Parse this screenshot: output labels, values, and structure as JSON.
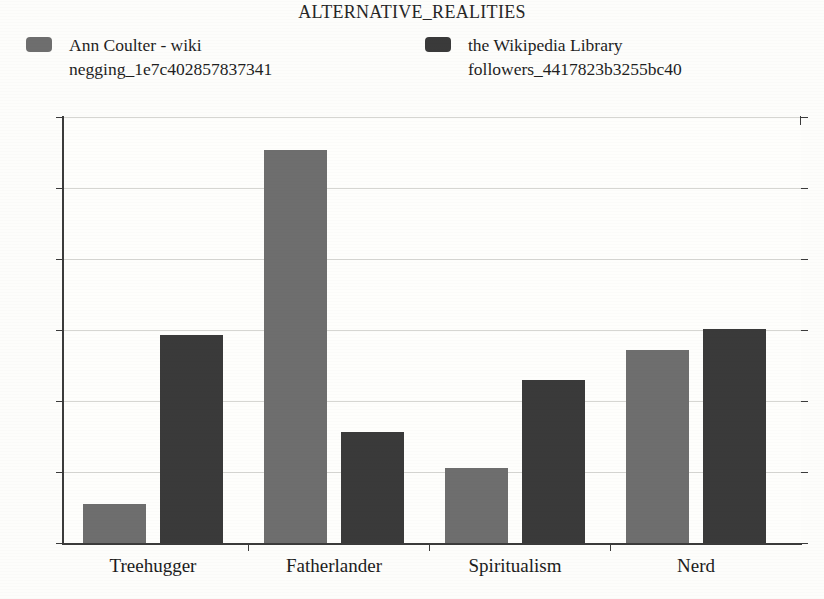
{
  "chart_data": {
    "type": "bar",
    "title": "ALTERNATIVE_REALITIES",
    "xlabel": "",
    "ylabel": "",
    "categories": [
      "Treehugger",
      "Fatherlander",
      "Spiritualism",
      "Nerd"
    ],
    "series": [
      {
        "name": "Ann Coulter - wiki negging_1e7c402857837341",
        "color": "#6e6e6e",
        "values": [
          0.055,
          0.553,
          0.105,
          0.272
        ]
      },
      {
        "name": "the Wikipedia Library followers_4417823b3255bc40",
        "color": "#3a3a3a",
        "values": [
          0.293,
          0.157,
          0.229,
          0.301
        ]
      }
    ],
    "ylim": [
      0,
      0.6
    ],
    "yticks": [
      0,
      0.1,
      0.2,
      0.3,
      0.4,
      0.5,
      0.6
    ],
    "ytick_labels": [
      "0",
      "0.1",
      "0.2",
      "0.3",
      "0.4",
      "0.5",
      "0.6"
    ],
    "grid": true,
    "legend_position": "top"
  },
  "legend": {
    "entries": [
      {
        "label": "Ann Coulter - wiki\nnegging_1e7c402857837341",
        "color": "#6e6e6e"
      },
      {
        "label": "the Wikipedia Library\nfollowers_4417823b3255bc40",
        "color": "#3a3a3a"
      }
    ]
  },
  "colors": {
    "series_1": "#6e6e6e",
    "series_2": "#3a3a3a",
    "axis": "#3b3b3b",
    "grid": "#d6d6d2",
    "background": "#fdfdfb",
    "text": "#1c1c1c"
  }
}
